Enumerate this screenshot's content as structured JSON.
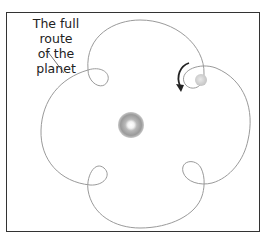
{
  "diagram": {
    "label": {
      "line1": "The full route",
      "line2": "of the planet"
    },
    "colors": {
      "route": "#9a9a9a",
      "frame": "#333333",
      "arrow": "#222222",
      "sun": "#a0a0a0",
      "planet": "#d0d0d0"
    },
    "elements": [
      "central-body",
      "planet",
      "planet-route",
      "direction-arrow",
      "label-pointer"
    ]
  }
}
